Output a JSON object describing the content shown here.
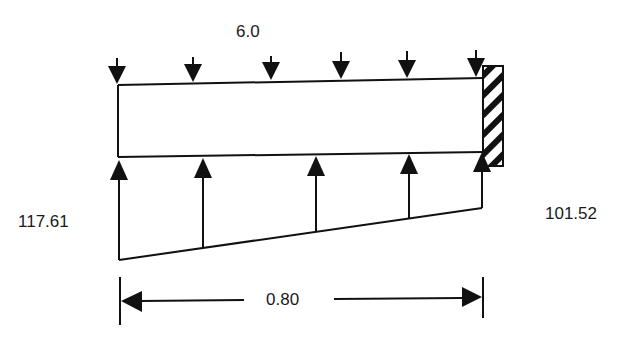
{
  "diagram": {
    "type": "cantilever beam free-body diagram",
    "distributed_load": {
      "label": "6.0",
      "direction": "down",
      "arrow_count": 6
    },
    "reaction_load": {
      "left_value": "117.61",
      "right_value": "101.52",
      "direction": "up",
      "arrow_count": 5,
      "shape": "trapezoidal"
    },
    "dimension": {
      "label": "0.80"
    },
    "support": {
      "type": "fixed",
      "side": "right",
      "style": "hatched"
    }
  },
  "colors": {
    "stroke": "#111111",
    "background": "#ffffff"
  }
}
